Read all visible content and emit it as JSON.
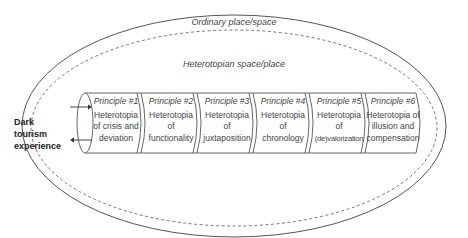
{
  "outer_region": {
    "label": "Ordinary place/space"
  },
  "inner_region": {
    "label": "Heterotopian space/place"
  },
  "entry": {
    "label_lines": [
      "Dark",
      "tourism",
      "experience"
    ]
  },
  "principles": [
    {
      "title": "Principle #1",
      "lines": [
        "Heterotopia",
        "of crisis and",
        "deviation"
      ]
    },
    {
      "title": "Principle #2",
      "lines": [
        "Heterotopia",
        "of",
        "functionality"
      ]
    },
    {
      "title": "Principle #3",
      "lines": [
        "Heterotopia",
        "of",
        "juxtaposition"
      ]
    },
    {
      "title": "Principle #4",
      "lines": [
        "Heterotopia",
        "of",
        "chronology"
      ]
    },
    {
      "title": "Principle #5",
      "lines": [
        "Heterotopia",
        "of",
        "(de)valorization"
      ]
    },
    {
      "title": "Principle #6",
      "lines": [
        "Heterotopia of",
        "illusion and",
        "compensation"
      ]
    }
  ],
  "colors": {
    "stroke": "#555555",
    "text": "#444444",
    "background": "#ffffff"
  }
}
